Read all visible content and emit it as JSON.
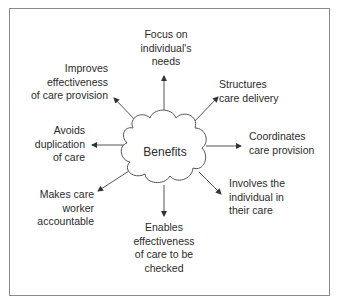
{
  "diagram": {
    "type": "radial-mind-map",
    "center": {
      "label": "Benefits",
      "shape": "cloud"
    },
    "colors": {
      "line": "#555555",
      "text": "#2b2b2b",
      "border": "#8a8a8a",
      "background": "#ffffff"
    },
    "nodes": [
      {
        "id": "top",
        "label": "Focus on\nindividual's\nneeds"
      },
      {
        "id": "top-right",
        "label": "Structures\ncare delivery"
      },
      {
        "id": "right",
        "label": "Coordinates\ncare provision"
      },
      {
        "id": "bottom-right",
        "label": "Involves the\nindividual in\ntheir care"
      },
      {
        "id": "bottom",
        "label": "Enables\neffectiveness\nof care to be\nchecked"
      },
      {
        "id": "bottom-left",
        "label": "Makes care\nworker\naccountable"
      },
      {
        "id": "left",
        "label": "Avoids\nduplication\nof care"
      },
      {
        "id": "top-left",
        "label": "Improves\neffectiveness\nof care provision"
      }
    ]
  }
}
